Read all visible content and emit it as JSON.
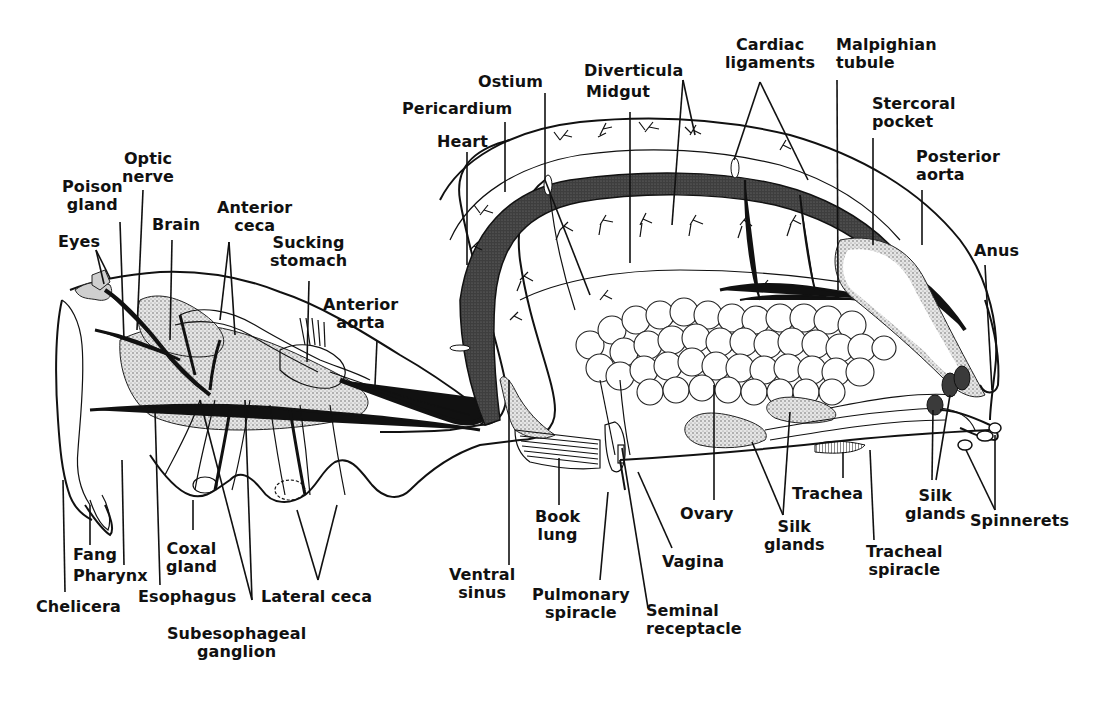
{
  "diagram": {
    "colors": {
      "ink": "#111111",
      "background": "#ffffff",
      "heart_fill": "#4a4a4a",
      "stipple": "#cfcfcf"
    }
  },
  "labels": {
    "optic_nerve": "Optic\nnerve",
    "poison_gland": "Poison\ngland",
    "eyes": "Eyes",
    "brain": "Brain",
    "anterior_ceca": "Anterior\nceca",
    "sucking_stomach": "Sucking\nstomach",
    "anterior_aorta": "Anterior\naorta",
    "heart": "Heart",
    "pericardium": "Pericardium",
    "ostium": "Ostium",
    "diverticula": "Diverticula",
    "midgut": "Midgut",
    "cardiac_ligaments": "Cardiac\nligaments",
    "malpighian_tubule": "Malpighian\ntubule",
    "stercoral_pocket": "Stercoral\npocket",
    "posterior_aorta": "Posterior\naorta",
    "anus": "Anus",
    "fang": "Fang",
    "pharynx": "Pharynx",
    "chelicera": "Chelicera",
    "coxal_gland": "Coxal\ngland",
    "esophagus": "Esophagus",
    "lateral_ceca": "Lateral ceca",
    "subesophageal_ganglion": "Subesophageal\nganglion",
    "ventral_sinus": "Ventral\nsinus",
    "book_lung": "Book\nlung",
    "pulmonary_spiracle": "Pulmonary\nspiracle",
    "seminal_receptacle": "Seminal\nreceptacle",
    "vagina": "Vagina",
    "ovary": "Ovary",
    "silk_glands_ventral": "Silk\nglands",
    "trachea": "Trachea",
    "tracheal_spiracle": "Tracheal\nspiracle",
    "silk_glands_posterior": "Silk\nglands",
    "spinnerets": "Spinnerets"
  }
}
